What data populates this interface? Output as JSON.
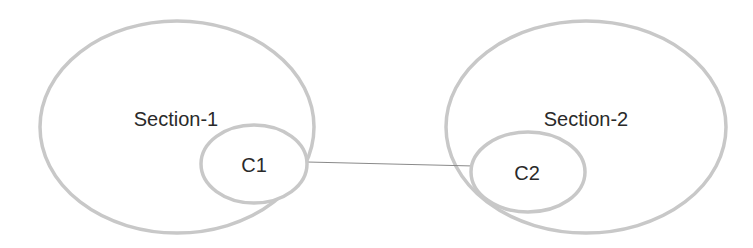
{
  "diagram": {
    "type": "network",
    "nodes": [
      {
        "id": "section-1",
        "label": "Section-1",
        "kind": "container"
      },
      {
        "id": "c1",
        "label": "C1",
        "kind": "component",
        "parent": "section-1"
      },
      {
        "id": "section-2",
        "label": "Section-2",
        "kind": "container"
      },
      {
        "id": "c2",
        "label": "C2",
        "kind": "component",
        "parent": "section-2"
      }
    ],
    "edges": [
      {
        "from": "c1",
        "to": "c2"
      }
    ]
  },
  "labels": {
    "section1": "Section-1",
    "c1": "C1",
    "section2": "Section-2",
    "c2": "C2"
  },
  "colors": {
    "outline": "#c8c8c8",
    "connector": "#8a8a8a",
    "text": "#2a2a2a"
  }
}
